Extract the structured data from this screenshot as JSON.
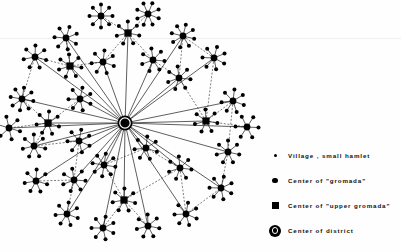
{
  "figure": {
    "type": "radial-hierarchy-network",
    "background": "#fefefe",
    "ink": "#000000",
    "width": 401,
    "height": 252
  },
  "legend": {
    "items": [
      {
        "symbol": "village-dot",
        "label": "Village , small  hamlet"
      },
      {
        "symbol": "gromada-dot",
        "label": "Center  of \"gromada\""
      },
      {
        "symbol": "upper-square",
        "label": "Center  of \"upper gromada\""
      },
      {
        "symbol": "district-ring",
        "label": "Center  of  district"
      }
    ]
  },
  "network": {
    "center": {
      "x": 125,
      "y": 123,
      "type": "district",
      "r": 7.5
    },
    "style": {
      "spoke_color": "#1a1a1a",
      "spoke_width": 0.7,
      "dashed_color": "#2a2a2a",
      "dashed_width": 0.6,
      "dash_pattern": "2,1.6",
      "village_r": 2.0,
      "gromada_r": 3.4,
      "upper_half": 3.6,
      "cluster_radius": 11.5
    },
    "clusters": [
      {
        "id": "c01",
        "x": 128,
        "y": 33,
        "type": "upper",
        "villages": 7,
        "rot": 12
      },
      {
        "id": "c02",
        "x": 103,
        "y": 62,
        "type": "gromada",
        "villages": 7,
        "rot": 20
      },
      {
        "id": "c03",
        "x": 153,
        "y": 60,
        "type": "gromada",
        "villages": 7,
        "rot": 5
      },
      {
        "id": "c04",
        "x": 101,
        "y": 16,
        "type": "gromada",
        "villages": 8,
        "rot": 0
      },
      {
        "id": "c05",
        "x": 148,
        "y": 14,
        "type": "gromada",
        "villages": 8,
        "rot": 22
      },
      {
        "id": "c06",
        "x": 66,
        "y": 38,
        "type": "gromada",
        "villages": 7,
        "rot": 30
      },
      {
        "id": "c07",
        "x": 70,
        "y": 66,
        "type": "upper",
        "villages": 7,
        "rot": 8
      },
      {
        "id": "c08",
        "x": 35,
        "y": 57,
        "type": "gromada",
        "villages": 7,
        "rot": 15
      },
      {
        "id": "c09",
        "x": 22,
        "y": 99,
        "type": "gromada",
        "villages": 8,
        "rot": 10
      },
      {
        "id": "c10",
        "x": 48,
        "y": 123,
        "type": "upper",
        "villages": 7,
        "rot": 18
      },
      {
        "id": "c11",
        "x": 80,
        "y": 99,
        "type": "gromada",
        "villages": 7,
        "rot": 25
      },
      {
        "id": "c12",
        "x": 183,
        "y": 36,
        "type": "gromada",
        "villages": 8,
        "rot": 14
      },
      {
        "id": "c13",
        "x": 179,
        "y": 78,
        "type": "gromada",
        "villages": 7,
        "rot": 6
      },
      {
        "id": "c14",
        "x": 214,
        "y": 58,
        "type": "gromada",
        "villages": 7,
        "rot": 28
      },
      {
        "id": "c15",
        "x": 206,
        "y": 121,
        "type": "upper",
        "villages": 7,
        "rot": 10
      },
      {
        "id": "c16",
        "x": 233,
        "y": 101,
        "type": "gromada",
        "villages": 7,
        "rot": 20
      },
      {
        "id": "c17",
        "x": 34,
        "y": 146,
        "type": "gromada",
        "villages": 7,
        "rot": 12
      },
      {
        "id": "c18",
        "x": 79,
        "y": 141,
        "type": "gromada",
        "villages": 7,
        "rot": 24
      },
      {
        "id": "c19",
        "x": 36,
        "y": 181,
        "type": "gromada",
        "villages": 7,
        "rot": 16
      },
      {
        "id": "c20",
        "x": 74,
        "y": 180,
        "type": "gromada",
        "villages": 7,
        "rot": 4
      },
      {
        "id": "c21",
        "x": 67,
        "y": 214,
        "type": "gromada",
        "villages": 7,
        "rot": 21
      },
      {
        "id": "c22",
        "x": 104,
        "y": 165,
        "type": "gromada",
        "villages": 8,
        "rot": 9
      },
      {
        "id": "c23",
        "x": 124,
        "y": 200,
        "type": "upper",
        "villages": 7,
        "rot": 15
      },
      {
        "id": "c24",
        "x": 103,
        "y": 228,
        "type": "gromada",
        "villages": 7,
        "rot": 26
      },
      {
        "id": "c25",
        "x": 148,
        "y": 226,
        "type": "gromada",
        "villages": 7,
        "rot": 11
      },
      {
        "id": "c26",
        "x": 146,
        "y": 148,
        "type": "gromada",
        "villages": 7,
        "rot": 19
      },
      {
        "id": "c27",
        "x": 180,
        "y": 168,
        "type": "gromada",
        "villages": 7,
        "rot": 7
      },
      {
        "id": "c28",
        "x": 186,
        "y": 214,
        "type": "gromada",
        "villages": 7,
        "rot": 23
      },
      {
        "id": "c29",
        "x": 228,
        "y": 152,
        "type": "gromada",
        "villages": 7,
        "rot": 13
      },
      {
        "id": "c30",
        "x": 221,
        "y": 188,
        "type": "gromada",
        "villages": 7,
        "rot": 27
      },
      {
        "id": "c31",
        "x": 247,
        "y": 127,
        "type": "gromada",
        "villages": 6,
        "rot": 3
      },
      {
        "id": "c32",
        "x": 9,
        "y": 128,
        "type": "gromada",
        "villages": 6,
        "rot": 17
      }
    ],
    "hub_links": [
      "c01",
      "c02",
      "c03",
      "c06",
      "c07",
      "c08",
      "c09",
      "c10",
      "c11",
      "c12",
      "c13",
      "c14",
      "c15",
      "c16",
      "c17",
      "c18",
      "c19",
      "c20",
      "c21",
      "c22",
      "c23",
      "c24",
      "c25",
      "c26",
      "c27",
      "c28",
      "c29",
      "c30",
      "c31",
      "c32"
    ],
    "sub_links": [
      [
        "c01",
        "c04"
      ],
      [
        "c01",
        "c05"
      ],
      [
        "c01",
        "c02"
      ],
      [
        "c01",
        "c03"
      ],
      [
        "c07",
        "c06"
      ],
      [
        "c07",
        "c08"
      ],
      [
        "c07",
        "c02"
      ],
      [
        "c10",
        "c09"
      ],
      [
        "c10",
        "c11"
      ],
      [
        "c10",
        "c17"
      ],
      [
        "c10",
        "c32"
      ],
      [
        "c15",
        "c13"
      ],
      [
        "c15",
        "c14"
      ],
      [
        "c15",
        "c16"
      ],
      [
        "c15",
        "c31"
      ],
      [
        "c23",
        "c22"
      ],
      [
        "c23",
        "c24"
      ],
      [
        "c23",
        "c25"
      ],
      [
        "c23",
        "c27"
      ],
      [
        "c12",
        "c13"
      ],
      [
        "c12",
        "c14"
      ],
      [
        "c18",
        "c17"
      ],
      [
        "c18",
        "c20"
      ],
      [
        "c19",
        "c20"
      ],
      [
        "c20",
        "c21"
      ],
      [
        "c26",
        "c27"
      ],
      [
        "c27",
        "c28"
      ],
      [
        "c29",
        "c30"
      ],
      [
        "c16",
        "c29"
      ],
      [
        "c03",
        "c13"
      ],
      [
        "c09",
        "c08"
      ],
      [
        "c22",
        "c26"
      ],
      [
        "c28",
        "c30"
      ]
    ]
  }
}
